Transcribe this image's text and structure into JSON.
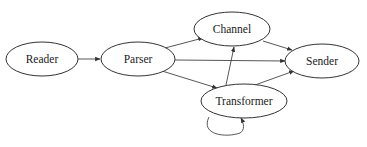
{
  "diagram": {
    "type": "directed-graph",
    "nodes": [
      {
        "id": "reader",
        "label": "Reader",
        "cx": 42,
        "cy": 59,
        "rx": 36,
        "ry": 17
      },
      {
        "id": "parser",
        "label": "Parser",
        "cx": 138,
        "cy": 59,
        "rx": 37,
        "ry": 17
      },
      {
        "id": "channel",
        "label": "Channel",
        "cx": 232,
        "cy": 29,
        "rx": 38,
        "ry": 17
      },
      {
        "id": "sender",
        "label": "Sender",
        "cx": 322,
        "cy": 61,
        "rx": 37,
        "ry": 17
      },
      {
        "id": "transformer",
        "label": "Transformer",
        "cx": 244,
        "cy": 101,
        "rx": 43,
        "ry": 17
      }
    ],
    "edges": [
      {
        "from": "reader",
        "to": "parser"
      },
      {
        "from": "parser",
        "to": "channel"
      },
      {
        "from": "parser",
        "to": "sender"
      },
      {
        "from": "parser",
        "to": "transformer"
      },
      {
        "from": "channel",
        "to": "sender"
      },
      {
        "from": "transformer",
        "to": "channel"
      },
      {
        "from": "transformer",
        "to": "sender"
      },
      {
        "from": "transformer",
        "to": "transformer"
      }
    ]
  },
  "labels": {
    "reader": "Reader",
    "parser": "Parser",
    "channel": "Channel",
    "sender": "Sender",
    "transformer": "Transformer"
  },
  "colors": {
    "background": "#ffffff",
    "stroke": "#333333",
    "text": "#1a1a1a"
  }
}
